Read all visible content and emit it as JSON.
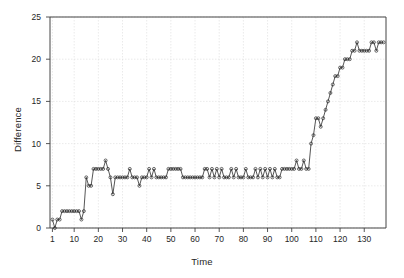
{
  "chart_data": {
    "type": "line",
    "title": "",
    "xlabel": "Time",
    "ylabel": "Difference",
    "xlim": [
      0,
      139
    ],
    "ylim": [
      0,
      25
    ],
    "grid": true,
    "legend": null,
    "marker": "open-circle",
    "line_style": "solid-step",
    "xticks": [
      1,
      10,
      20,
      30,
      40,
      50,
      60,
      70,
      80,
      90,
      100,
      110,
      120,
      130
    ],
    "xtick_labels": [
      "1",
      "10",
      "20",
      "30",
      "40",
      "50",
      "60",
      "70",
      "80",
      "90",
      "100",
      "110",
      "120",
      "130"
    ],
    "yticks": [
      0,
      5,
      10,
      15,
      20,
      25
    ],
    "ytick_labels": [
      "0",
      "5",
      "10",
      "15",
      "20",
      "25"
    ],
    "series": [
      {
        "name": "Difference",
        "color": "#2b2b2b",
        "x": [
          1,
          2,
          3,
          4,
          5,
          6,
          7,
          8,
          9,
          10,
          11,
          12,
          13,
          14,
          15,
          16,
          17,
          18,
          19,
          20,
          21,
          22,
          23,
          24,
          25,
          26,
          27,
          28,
          29,
          30,
          31,
          32,
          33,
          34,
          35,
          36,
          37,
          38,
          39,
          40,
          41,
          42,
          43,
          44,
          45,
          46,
          47,
          48,
          49,
          50,
          51,
          52,
          53,
          54,
          55,
          56,
          57,
          58,
          59,
          60,
          61,
          62,
          63,
          64,
          65,
          66,
          67,
          68,
          69,
          70,
          71,
          72,
          73,
          74,
          75,
          76,
          77,
          78,
          79,
          80,
          81,
          82,
          83,
          84,
          85,
          86,
          87,
          88,
          89,
          90,
          91,
          92,
          93,
          94,
          95,
          96,
          97,
          98,
          99,
          100,
          101,
          102,
          103,
          104,
          105,
          106,
          107,
          108,
          109,
          110,
          111,
          112,
          113,
          114,
          115,
          116,
          117,
          118,
          119,
          120,
          121,
          122,
          123,
          124,
          125,
          126,
          127,
          128,
          129,
          130,
          131,
          132,
          133,
          134,
          135,
          136,
          137,
          138
        ],
        "values": [
          1,
          0,
          1,
          1,
          2,
          2,
          2,
          2,
          2,
          2,
          2,
          2,
          1,
          2,
          6,
          5,
          5,
          7,
          7,
          7,
          7,
          7,
          8,
          7,
          6,
          4,
          6,
          6,
          6,
          6,
          6,
          6,
          7,
          6,
          6,
          6,
          5,
          6,
          6,
          6,
          7,
          6,
          7,
          6,
          6,
          6,
          6,
          6,
          7,
          7,
          7,
          7,
          7,
          7,
          6,
          6,
          6,
          6,
          6,
          6,
          6,
          6,
          6,
          7,
          7,
          6,
          7,
          6,
          7,
          6,
          7,
          6,
          6,
          6,
          7,
          6,
          7,
          6,
          6,
          6,
          7,
          6,
          6,
          6,
          7,
          6,
          7,
          6,
          7,
          6,
          7,
          6,
          7,
          6,
          6,
          7,
          7,
          7,
          7,
          7,
          7,
          8,
          7,
          7,
          8,
          7,
          7,
          10,
          11,
          13,
          13,
          12,
          13,
          14,
          15,
          16,
          17,
          18,
          18,
          19,
          19,
          20,
          20,
          20,
          21,
          21,
          22,
          21,
          21,
          21,
          21,
          21,
          22,
          22,
          21,
          22,
          22,
          22
        ]
      }
    ]
  },
  "axes": {
    "frame_color": "#444444",
    "grid_color": "#dcdcdc",
    "background": "#ffffff"
  }
}
